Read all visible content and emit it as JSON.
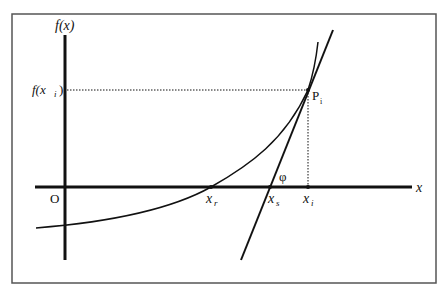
{
  "diagram": {
    "type": "newton-method-tangent",
    "labels": {
      "y_axis": "f(x)",
      "x_axis": "x",
      "origin": "O",
      "f_xi": "f(x",
      "f_xi_sub": "i",
      "f_xi_close": ")",
      "point": "P",
      "point_sub": "i",
      "xr": "x",
      "xr_sub": "r",
      "xs": "x",
      "xs_sub": "s",
      "xi": "x",
      "xi_sub": "i",
      "angle": "φ"
    },
    "colors": {
      "line": "#111111",
      "frame": "#555555",
      "background": "#ffffff"
    }
  }
}
